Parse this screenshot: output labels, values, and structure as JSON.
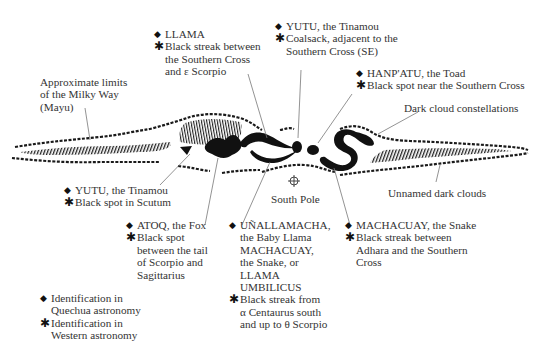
{
  "figure": {
    "type": "illustration of dark cloud constellations of the Milky Way",
    "band_label": "Approximate limits of the Milky Way (Mayu)",
    "band_label_lines": [
      "Approximate limits",
      "of the Milky Way",
      "(Mayu)"
    ],
    "dark_cloud_label": "Dark cloud constellations",
    "unnamed_label": "Unnamed dark clouds",
    "south_pole_label": "South Pole",
    "symbols": {
      "quechua": "◆",
      "western": "✱"
    },
    "colors": {
      "ink": "#111111",
      "text": "#333333",
      "leader": "#777777",
      "background": "#ffffff"
    }
  },
  "annotations": [
    {
      "id": "llama",
      "quechua": "LLAMA",
      "western_lines": [
        "Black streak between",
        "the Southern Cross",
        "and ε Scorpio"
      ]
    },
    {
      "id": "yutu-coalsack",
      "quechua": "YUTU, the Tinamou",
      "western_lines": [
        "Coalsack, adjacent to the",
        "Southern Cross (SE)"
      ]
    },
    {
      "id": "hanpatu",
      "quechua": "HANP'ATU, the Toad",
      "western_lines": [
        "Black spot near the Southern Cross"
      ]
    },
    {
      "id": "yutu-scutum",
      "quechua": "YUTU, the Tinamou",
      "western_lines": [
        "Black spot in Scutum"
      ]
    },
    {
      "id": "atoq",
      "quechua": "ATOQ, the Fox",
      "western_lines": [
        "Black spot",
        "between the tail",
        "of Scorpio and",
        "Sagittarius"
      ]
    },
    {
      "id": "unallamacha",
      "quechua_lines": [
        "UÑALLAMACHA,",
        "the Baby Llama",
        "MACHACUAY,",
        "the Snake, or",
        "LLAMA",
        "UMBILICUS"
      ],
      "western_lines": [
        "Black streak from",
        "α Centaurus south",
        "and up to θ Scorpio"
      ]
    },
    {
      "id": "machacuay",
      "quechua": "MACHACUAY, the Snake",
      "western_lines": [
        "Black streak between",
        "Adhara and the Southern",
        "Cross"
      ]
    }
  ],
  "legend": {
    "quechua_lines": [
      "Identification in",
      "Quechua astronomy"
    ],
    "western_lines": [
      "Identification in",
      "Western astronomy"
    ]
  }
}
